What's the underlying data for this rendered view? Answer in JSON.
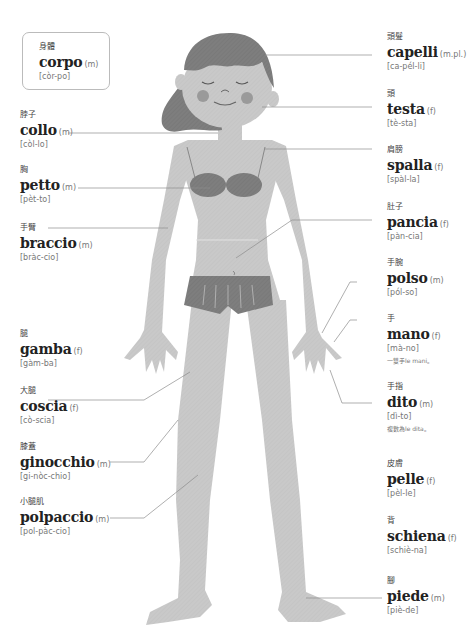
{
  "colors": {
    "skin": "#c8c8c8",
    "hair": "#8a8a8a",
    "clothing": "#7a7a7a",
    "cheeks": "#999999",
    "leader_line": "#888888",
    "box_border": "#bbbbbb"
  },
  "title_box": {
    "zh": "身體",
    "word": "corpo",
    "gender": "(m)",
    "pron": "[còr-po]"
  },
  "labels": {
    "capelli": {
      "zh": "頭髮",
      "word": "capelli",
      "gender": "(m.pl.)",
      "pron": "[ca-pél-li]"
    },
    "testa": {
      "zh": "頭",
      "word": "testa",
      "gender": "(f)",
      "pron": "[tè-sta]"
    },
    "spalla": {
      "zh": "肩膀",
      "word": "spalla",
      "gender": "(f)",
      "pron": "[spàl-la]"
    },
    "pancia": {
      "zh": "肚子",
      "word": "pancia",
      "gender": "(f)",
      "pron": "[pàn-cia]"
    },
    "polso": {
      "zh": "手腕",
      "word": "polso",
      "gender": "(m)",
      "pron": "[pól-so]"
    },
    "mano": {
      "zh": "手",
      "word": "mano",
      "gender": "(f)",
      "pron": "[mà-no]",
      "note": "一雙手le mani。"
    },
    "dito": {
      "zh": "手指",
      "word": "dito",
      "gender": "(m)",
      "pron": "[dì-to]",
      "note": "複數為le dita。"
    },
    "pelle": {
      "zh": "皮膚",
      "word": "pelle",
      "gender": "(f)",
      "pron": "[pèl-le]"
    },
    "schiena": {
      "zh": "背",
      "word": "schiena",
      "gender": "(f)",
      "pron": "[schiè-na]"
    },
    "piede": {
      "zh": "腳",
      "word": "piede",
      "gender": "(m)",
      "pron": "[piè-de]"
    },
    "collo": {
      "zh": "脖子",
      "word": "collo",
      "gender": "(m)",
      "pron": "[còl-lo]"
    },
    "petto": {
      "zh": "胸",
      "word": "petto",
      "gender": "(m)",
      "pron": "[pèt-to]"
    },
    "braccio": {
      "zh": "手臂",
      "word": "braccio",
      "gender": "(m)",
      "pron": "[bràc-cio]"
    },
    "gamba": {
      "zh": "腿",
      "word": "gamba",
      "gender": "(f)",
      "pron": "[gàm-ba]"
    },
    "coscia": {
      "zh": "大腿",
      "word": "coscia",
      "gender": "(f)",
      "pron": "[cò-scia]"
    },
    "ginocchio": {
      "zh": "膝蓋",
      "word": "ginocchio",
      "gender": "(m)",
      "pron": "[gi-nòc-chio]"
    },
    "polpaccio": {
      "zh": "小腿肌",
      "word": "polpaccio",
      "gender": "(m)",
      "pron": "[pol-pàc-cio]"
    }
  }
}
